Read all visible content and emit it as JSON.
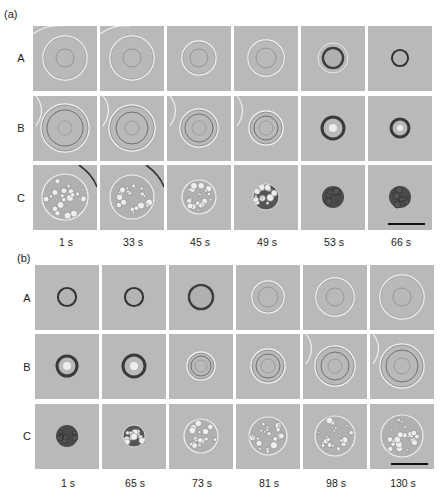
{
  "figure": {
    "parts": [
      {
        "label": "(a)",
        "rows": [
          "A",
          "B",
          "C"
        ],
        "times": [
          "1 s",
          "33 s",
          "45 s",
          "49 s",
          "53 s",
          "66 s"
        ],
        "description": "Cell shrinkage time-lapse: rows A, B, C over six time points"
      },
      {
        "label": "(b)",
        "rows": [
          "A",
          "B",
          "C"
        ],
        "times": [
          "1 s",
          "65 s",
          "73 s",
          "81 s",
          "98 s",
          "130 s"
        ],
        "description": "Cell re-expansion time-lapse: rows A, B, C over six time points"
      }
    ],
    "scale_bar": {
      "present": true,
      "location": "bottom-right panel of each part"
    },
    "colors": {
      "panel_bg": "#b9b9b9",
      "cell_dark": "#3a3a3a",
      "membrane_light": "#f2f2f2"
    }
  }
}
